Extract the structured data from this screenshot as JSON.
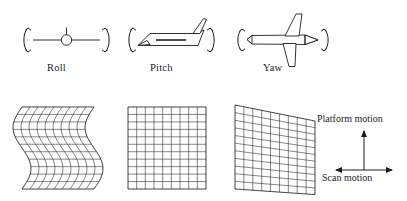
{
  "figure": {
    "stroke_color": "#1d1d1d",
    "background_color": "#ffffff"
  },
  "attitude_row": {
    "items": [
      {
        "id": "roll",
        "label": "Roll",
        "view": "front-view",
        "icon": "aircraft-front-view-icon",
        "rotation_arrows": "curved-double-arrow-pair"
      },
      {
        "id": "pitch",
        "label": "Pitch",
        "view": "side-view",
        "icon": "aircraft-side-view-icon",
        "rotation_arrows": "curved-double-arrow-pair"
      },
      {
        "id": "yaw",
        "label": "Yaw",
        "view": "top-view",
        "icon": "aircraft-top-view-icon",
        "rotation_arrows": "curved-double-arrow-pair"
      }
    ]
  },
  "distortion_row": {
    "grids": [
      {
        "id": "roll-distortion",
        "name": "wavy-distorted-grid",
        "description": "S-curved sinusoidal column distortion",
        "columns": 9,
        "rows": 11,
        "wave_amplitude": 9,
        "wave_cycles": 1
      },
      {
        "id": "pitch-distortion",
        "name": "regular-grid",
        "description": "Undistorted rectangular grid",
        "columns": 9,
        "rows": 11,
        "wave_amplitude": 0,
        "wave_cycles": 0
      },
      {
        "id": "yaw-distortion",
        "name": "sheared-grid",
        "description": "Trapezoidal shear, rows tilt upward to the right",
        "columns": 9,
        "rows": 11,
        "shear_drop": 16
      }
    ]
  },
  "legend": {
    "platform_motion_label": "Platform motion",
    "scan_motion_label": "Scan motion",
    "platform_arrow": "arrow-up-icon",
    "scan_arrow": "double-arrow-horizontal-icon"
  }
}
